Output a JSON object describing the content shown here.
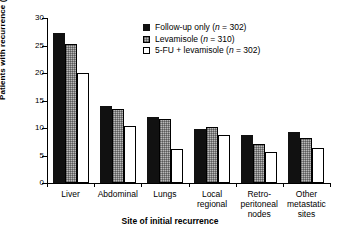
{
  "chart_data": {
    "type": "bar",
    "title": "",
    "xlabel": "Site of initial recurrence",
    "ylabel": "Patients with recurrence (%)",
    "ylim": [
      0,
      30
    ],
    "yticks": [
      0,
      5,
      10,
      15,
      20,
      25,
      30
    ],
    "grid": false,
    "legend_position": "top-right",
    "categories": [
      "Liver",
      "Abdominal",
      "Lungs",
      "Local\nregional",
      "Retro-\nperitoneal\nnodes",
      "Other\nmetastatic\nsites"
    ],
    "series": [
      {
        "name": "Follow-up only (n = 302)",
        "label_main": "Follow-up only (",
        "label_italic": "n",
        "label_tail": " = 302)",
        "n": 302,
        "fill": "#111111",
        "style": "solid-black",
        "values": [
          27.2,
          14.0,
          12.0,
          9.8,
          8.8,
          9.2
        ]
      },
      {
        "name": "Levamisole (n = 310)",
        "label_main": "Levamisole (",
        "label_italic": "n",
        "label_tail": " = 310)",
        "n": 310,
        "fill": "#b9b9b9",
        "style": "hatched-gray",
        "values": [
          25.2,
          13.5,
          11.7,
          10.2,
          7.1,
          8.1
        ]
      },
      {
        "name": "5-FU + levamisole (n = 302)",
        "label_main": "5-FU + levamisole (",
        "label_italic": "n",
        "label_tail": " = 302)",
        "n": 302,
        "fill": "#ffffff",
        "style": "open-white",
        "values": [
          20.0,
          10.4,
          6.2,
          8.8,
          5.7,
          6.4
        ]
      }
    ]
  }
}
